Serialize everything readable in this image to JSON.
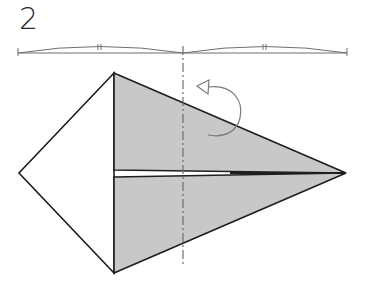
{
  "step": {
    "number": "2"
  },
  "colors": {
    "line": "#1e1e1e",
    "fill_shaded": "#c8c8c8",
    "fill_white": "#ffffff",
    "guide": "#6e6e6e",
    "arrow": "#7a7a7a"
  },
  "measure_bar": {
    "y": 53,
    "x_start": 18,
    "x_mid": 183,
    "x_end": 347,
    "tick_marks": [
      "||",
      "||"
    ]
  },
  "shape": {
    "top_vertex": [
      114,
      73
    ],
    "bottom_vertex": [
      114,
      273
    ],
    "left_vertex": [
      19,
      173
    ],
    "right_tip": [
      346,
      173
    ],
    "upper_flap_bottom_y": 170,
    "lower_flap_top_y": 177
  },
  "fold_line": {
    "type": "valley-dashed",
    "x": 183,
    "y_start": 45,
    "y_end": 265
  },
  "fold_arrow": {
    "direction": "fold-over-left",
    "label": ""
  }
}
